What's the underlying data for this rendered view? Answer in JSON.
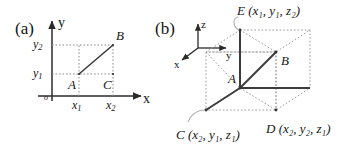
{
  "figure": {
    "panels": [
      {
        "tag": "(a)",
        "type": "2d-cartesian-plane",
        "axes": {
          "x_label": "x",
          "y_label": "y",
          "origin_label": "o"
        },
        "tick_labels": {
          "x1": "x",
          "x1_sub": "1",
          "x2": "x",
          "x2_sub": "2",
          "y1": "y",
          "y1_sub": "1",
          "y2": "y",
          "y2_sub": "2"
        },
        "points": [
          {
            "name": "A",
            "label": "A"
          },
          {
            "name": "B",
            "label": "B"
          },
          {
            "name": "C",
            "label": "C"
          }
        ]
      },
      {
        "tag": "(b)",
        "type": "3d-box-diagram",
        "axes": {
          "x_label": "x",
          "y_label": "y",
          "z_label": "z"
        },
        "points": [
          {
            "name": "A",
            "label": "A",
            "coords": ""
          },
          {
            "name": "B",
            "label": "B",
            "coords": ""
          },
          {
            "name": "C",
            "label": "C",
            "coords": "(x₂, y₁, z₁)"
          },
          {
            "name": "D",
            "label": "D",
            "coords": "(x₂, y₂, z₁)"
          },
          {
            "name": "E",
            "label": "E",
            "coords": "(x₁, y₁, z₂)"
          }
        ],
        "callout_labels": {
          "E_full": "E (x₁, y₁, z₂)",
          "C_full": "C (x₂, y₁, z₁)",
          "D_full": "D (x₂, y₂, z₁)"
        }
      }
    ],
    "colors": {
      "ink": "#1a1a1a",
      "solid_line": "#3c3c3c",
      "dotted_line": "#9a9a9a",
      "leader_line": "#b0b0b0",
      "background": "#ffffff"
    }
  }
}
